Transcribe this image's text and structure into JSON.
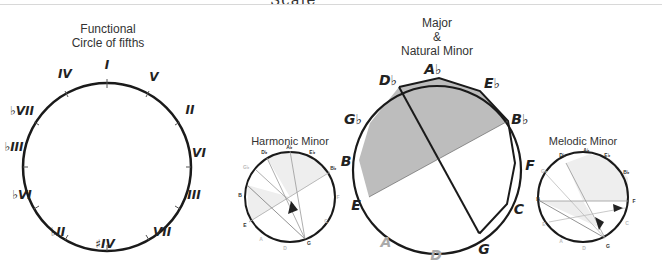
{
  "page": {
    "title_clipped": "Scale"
  },
  "functional": {
    "title_line1": "Functional",
    "title_line2": "Circle of fifths",
    "labels": [
      "I",
      "V",
      "II",
      "VI",
      "III",
      "VII",
      "#IV",
      "bII",
      "bVI",
      "bIII",
      "bVII",
      "IV"
    ]
  },
  "harmonic": {
    "title": "Harmonic Minor",
    "labels": [
      "Ab",
      "Eb",
      "Bb",
      "F",
      "C",
      "G",
      "D",
      "A",
      "E",
      "B",
      "Gb",
      "Db"
    ]
  },
  "major": {
    "title_line1": "Major",
    "title_line2": "&",
    "title_line3": "Natural Minor",
    "labels": [
      "Ab",
      "Eb",
      "Bb",
      "F",
      "C",
      "G",
      "D",
      "A",
      "E",
      "B",
      "Gb",
      "Db"
    ],
    "faded_labels": [
      "A",
      "D"
    ]
  },
  "melodic": {
    "title": "Melodic Minor",
    "labels": [
      "Ab",
      "Eb",
      "Bb",
      "F",
      "C",
      "G",
      "D",
      "A",
      "E",
      "B",
      "Gb",
      "Db"
    ]
  },
  "colors": {
    "stroke": "#1a1a1a",
    "shade": "#bdbdbd",
    "light_shade": "#e9e9e9",
    "faded_text": "#aaaaaa"
  }
}
